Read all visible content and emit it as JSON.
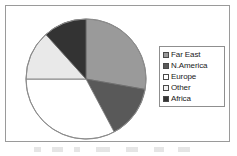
{
  "chart_data": {
    "type": "pie",
    "title": "",
    "legend_position": "right",
    "categories": [
      "Far East",
      "N.America",
      "Europe",
      "Other",
      "Africa"
    ],
    "values": [
      27.8,
      14.4,
      32.8,
      13.3,
      11.7
    ],
    "units": "percent",
    "start_angle_deg": 0,
    "direction": "clockwise",
    "slices": [
      {
        "label": "Far East",
        "value": 27.8,
        "start_deg": 0,
        "end_deg": 100,
        "color": "#9a9a9a"
      },
      {
        "label": "N.America",
        "value": 14.4,
        "start_deg": 100,
        "end_deg": 152,
        "color": "#595959"
      },
      {
        "label": "Europe",
        "value": 32.8,
        "start_deg": 152,
        "end_deg": 270,
        "color": "#ffffff"
      },
      {
        "label": "Other",
        "value": 13.3,
        "start_deg": 270,
        "end_deg": 318,
        "color": "#e9e9e9"
      },
      {
        "label": "Africa",
        "value": 11.7,
        "start_deg": 318,
        "end_deg": 360,
        "color": "#333333"
      }
    ]
  },
  "legend": {
    "items": [
      {
        "label": "Far East",
        "color": "#9a9a9a"
      },
      {
        "label": "N.America",
        "color": "#595959"
      },
      {
        "label": "Europe",
        "color": "#ffffff"
      },
      {
        "label": "Other",
        "color": "#f2f2f2"
      },
      {
        "label": "Africa",
        "color": "#333333"
      }
    ]
  },
  "style": {
    "frame_border_color": "#9a9a9a",
    "pie_outline_color": "#8c8c8c",
    "slice_edge_color": "#6e6e6e",
    "background": "#ffffff"
  }
}
